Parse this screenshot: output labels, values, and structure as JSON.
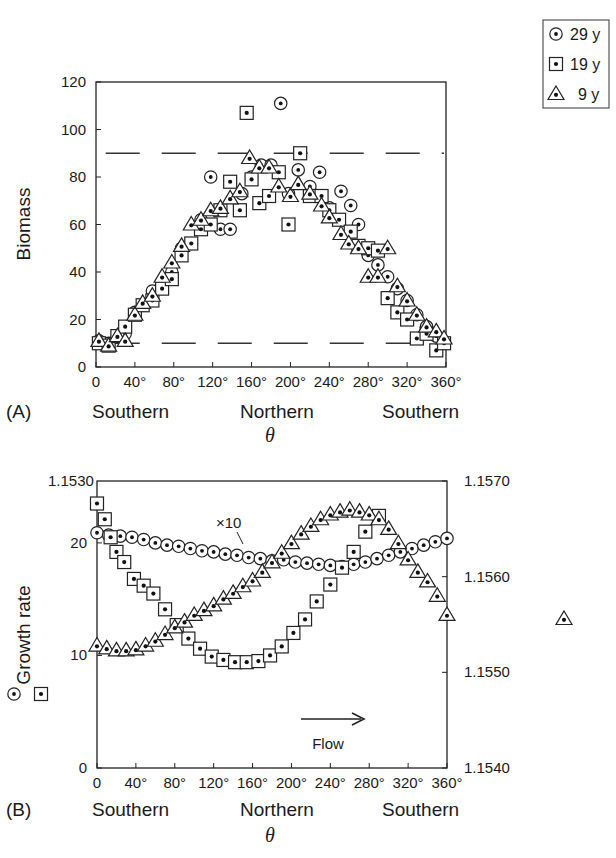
{
  "legend": {
    "items": [
      {
        "marker": "circle-dot",
        "label": "29 y"
      },
      {
        "marker": "square-dot",
        "label": "19 y"
      },
      {
        "marker": "triangle-dot",
        "label": "9 y"
      }
    ]
  },
  "panel_a": {
    "tag": "(A)",
    "ylabel": "Biomass",
    "xlabel": "θ",
    "yticks": [
      "0",
      "20",
      "40",
      "60",
      "80",
      "100",
      "120"
    ],
    "xticks": [
      "0",
      "40°",
      "80°",
      "120°",
      "160°",
      "200°",
      "240°",
      "280°",
      "320°",
      "360°"
    ],
    "regions": [
      "Southern",
      "Northern",
      "Southern"
    ]
  },
  "panel_b": {
    "tag": "(B)",
    "ylabel": "Growth rate",
    "xlabel": "θ",
    "yticks_left": [
      "0",
      "10",
      "20"
    ],
    "ytop_left": "1.1530",
    "yticks_right": [
      "1.1570",
      "1.1560",
      "1.1550",
      "1.1540"
    ],
    "xticks": [
      "0",
      "40°",
      "80°",
      "120°",
      "160°",
      "200°",
      "240°",
      "280°",
      "320°",
      "360°"
    ],
    "regions": [
      "Southern",
      "Northern",
      "Southern"
    ],
    "annotation": "×10",
    "flow_label": "Flow"
  },
  "chart_data": [
    {
      "type": "scatter",
      "title": "(A)",
      "xlabel": "θ",
      "ylabel": "Biomass",
      "xlim": [
        0,
        360
      ],
      "ylim": [
        0,
        120
      ],
      "x_regions": [
        "Southern",
        "Northern",
        "Southern"
      ],
      "reference_lines": [
        {
          "style": "dashed",
          "y": 90,
          "x_range": [
            10,
            360
          ]
        },
        {
          "style": "dashed",
          "y": 10,
          "x_range": [
            10,
            360
          ]
        }
      ],
      "legend_position": "top-right outside",
      "series": [
        {
          "name": "29 y",
          "marker": "circle-dot",
          "points": [
            [
              3,
              11
            ],
            [
              13,
              10
            ],
            [
              22,
              13
            ],
            [
              30,
              14
            ],
            [
              40,
              23
            ],
            [
              48,
              26
            ],
            [
              58,
              32
            ],
            [
              68,
              35
            ],
            [
              78,
              40
            ],
            [
              88,
              50
            ],
            [
              98,
              52
            ],
            [
              108,
              62
            ],
            [
              118,
              80
            ],
            [
              128,
              58
            ],
            [
              138,
              58
            ],
            [
              150,
              73
            ],
            [
              160,
              80
            ],
            [
              170,
              85
            ],
            [
              180,
              85
            ],
            [
              190,
              111
            ],
            [
              198,
              73
            ],
            [
              208,
              83
            ],
            [
              220,
              76
            ],
            [
              230,
              82
            ],
            [
              240,
              67
            ],
            [
              252,
              74
            ],
            [
              262,
              68
            ],
            [
              270,
              60
            ],
            [
              280,
              47
            ],
            [
              290,
              43
            ],
            [
              300,
              38
            ],
            [
              310,
              33
            ],
            [
              320,
              28
            ],
            [
              330,
              22
            ],
            [
              340,
              17
            ],
            [
              350,
              13
            ],
            [
              358,
              10
            ]
          ]
        },
        {
          "name": "19 y",
          "marker": "square-dot",
          "points": [
            [
              3,
              10
            ],
            [
              13,
              9
            ],
            [
              22,
              13
            ],
            [
              30,
              17
            ],
            [
              40,
              22
            ],
            [
              48,
              26
            ],
            [
              58,
              28
            ],
            [
              68,
              33
            ],
            [
              78,
              37
            ],
            [
              88,
              47
            ],
            [
              98,
              52
            ],
            [
              108,
              58
            ],
            [
              118,
              60
            ],
            [
              128,
              66
            ],
            [
              138,
              78
            ],
            [
              148,
              66
            ],
            [
              155,
              107
            ],
            [
              160,
              79
            ],
            [
              168,
              69
            ],
            [
              178,
              72
            ],
            [
              188,
              82
            ],
            [
              198,
              60
            ],
            [
              210,
              90
            ],
            [
              220,
              72
            ],
            [
              232,
              72
            ],
            [
              240,
              66
            ],
            [
              250,
              62
            ],
            [
              262,
              57
            ],
            [
              270,
              51
            ],
            [
              280,
              50
            ],
            [
              290,
              49
            ],
            [
              300,
              29
            ],
            [
              310,
              23
            ],
            [
              320,
              20
            ],
            [
              330,
              12
            ],
            [
              340,
              14
            ],
            [
              350,
              7
            ],
            [
              358,
              10
            ]
          ]
        },
        {
          "name": "9 y",
          "marker": "triangle-dot",
          "points": [
            [
              3,
              11
            ],
            [
              13,
              9
            ],
            [
              22,
              13
            ],
            [
              30,
              11
            ],
            [
              40,
              22
            ],
            [
              48,
              27
            ],
            [
              58,
              30
            ],
            [
              68,
              38
            ],
            [
              78,
              44
            ],
            [
              88,
              51
            ],
            [
              98,
              60
            ],
            [
              108,
              62
            ],
            [
              118,
              66
            ],
            [
              128,
              67
            ],
            [
              138,
              71
            ],
            [
              148,
              74
            ],
            [
              158,
              88
            ],
            [
              168,
              84
            ],
            [
              178,
              84
            ],
            [
              188,
              76
            ],
            [
              200,
              72
            ],
            [
              208,
              77
            ],
            [
              220,
              73
            ],
            [
              232,
              68
            ],
            [
              240,
              63
            ],
            [
              252,
              56
            ],
            [
              260,
              52
            ],
            [
              270,
              50
            ],
            [
              280,
              38
            ],
            [
              290,
              38
            ],
            [
              300,
              50
            ],
            [
              310,
              34
            ],
            [
              320,
              28
            ],
            [
              330,
              22
            ],
            [
              340,
              17
            ],
            [
              350,
              15
            ],
            [
              358,
              12
            ]
          ]
        }
      ]
    },
    {
      "type": "scatter",
      "title": "(B)",
      "xlabel": "θ",
      "ylabel": "Growth rate",
      "xlim": [
        0,
        360
      ],
      "ylim_left": [
        0,
        25.5
      ],
      "ylim_right": [
        1.154,
        1.157
      ],
      "left_axis_series": [
        "29 y",
        "19 y"
      ],
      "right_axis_series": [
        "9 y (×10)"
      ],
      "annotations": [
        "×10",
        "Flow →"
      ],
      "x_regions": [
        "Southern",
        "Northern",
        "Southern"
      ],
      "series": [
        {
          "name": "29 y",
          "marker": "circle-dot",
          "axis": "left",
          "points": [
            [
              0,
              20.9
            ],
            [
              12,
              20.7
            ],
            [
              24,
              20.6
            ],
            [
              36,
              20.5
            ],
            [
              48,
              20.3
            ],
            [
              60,
              20.0
            ],
            [
              72,
              19.8
            ],
            [
              84,
              19.7
            ],
            [
              96,
              19.5
            ],
            [
              108,
              19.3
            ],
            [
              120,
              19.2
            ],
            [
              132,
              19.0
            ],
            [
              144,
              18.9
            ],
            [
              156,
              18.7
            ],
            [
              168,
              18.6
            ],
            [
              180,
              18.4
            ],
            [
              192,
              18.5
            ],
            [
              204,
              18.3
            ],
            [
              216,
              18.2
            ],
            [
              228,
              18.1
            ],
            [
              240,
              18.0
            ],
            [
              252,
              17.9
            ],
            [
              264,
              18.1
            ],
            [
              276,
              18.3
            ],
            [
              288,
              18.6
            ],
            [
              300,
              18.9
            ],
            [
              312,
              19.2
            ],
            [
              324,
              19.5
            ],
            [
              336,
              19.8
            ],
            [
              348,
              20.1
            ],
            [
              360,
              20.4
            ]
          ]
        },
        {
          "name": "19 y",
          "marker": "square-dot",
          "axis": "left",
          "points": [
            [
              0,
              23.5
            ],
            [
              8,
              22.1
            ],
            [
              14,
              20.5
            ],
            [
              20,
              19.2
            ],
            [
              28,
              18.3
            ],
            [
              38,
              16.8
            ],
            [
              48,
              16.2
            ],
            [
              58,
              15.5
            ],
            [
              70,
              14.1
            ],
            [
              82,
              12.7
            ],
            [
              94,
              11.5
            ],
            [
              106,
              10.6
            ],
            [
              118,
              9.9
            ],
            [
              130,
              9.6
            ],
            [
              142,
              9.4
            ],
            [
              154,
              9.4
            ],
            [
              166,
              9.5
            ],
            [
              178,
              10.0
            ],
            [
              190,
              10.8
            ],
            [
              202,
              12.0
            ],
            [
              214,
              13.2
            ],
            [
              226,
              14.8
            ],
            [
              240,
              16.3
            ],
            [
              252,
              17.8
            ],
            [
              264,
              19.2
            ],
            [
              276,
              21.0
            ],
            [
              290,
              22.4
            ]
          ]
        },
        {
          "name": "9 y (×10)",
          "marker": "triangle-dot",
          "axis": "right",
          "values_note": "right axis scale",
          "points": [
            [
              0,
              1.15528
            ],
            [
              10,
              1.15525
            ],
            [
              20,
              1.15523
            ],
            [
              30,
              1.15523
            ],
            [
              40,
              1.15524
            ],
            [
              50,
              1.15528
            ],
            [
              60,
              1.15533
            ],
            [
              70,
              1.1554
            ],
            [
              80,
              1.15547
            ],
            [
              90,
              1.15553
            ],
            [
              100,
              1.1556
            ],
            [
              110,
              1.15565
            ],
            [
              120,
              1.1557
            ],
            [
              130,
              1.15577
            ],
            [
              140,
              1.15583
            ],
            [
              150,
              1.1559
            ],
            [
              160,
              1.15596
            ],
            [
              170,
              1.15605
            ],
            [
              180,
              1.15615
            ],
            [
              190,
              1.15625
            ],
            [
              200,
              1.15635
            ],
            [
              210,
              1.15645
            ],
            [
              220,
              1.15653
            ],
            [
              230,
              1.1566
            ],
            [
              240,
              1.15665
            ],
            [
              250,
              1.15668
            ],
            [
              260,
              1.1567
            ],
            [
              270,
              1.15668
            ],
            [
              280,
              1.15665
            ],
            [
              290,
              1.1566
            ],
            [
              300,
              1.1565
            ],
            [
              310,
              1.15635
            ],
            [
              320,
              1.15618
            ],
            [
              330,
              1.15605
            ],
            [
              340,
              1.15595
            ],
            [
              350,
              1.1558
            ],
            [
              360,
              1.1556
            ]
          ]
        }
      ]
    }
  ]
}
